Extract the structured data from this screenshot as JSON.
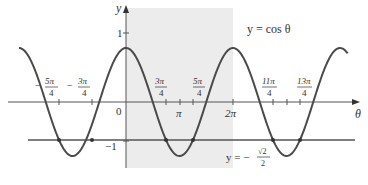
{
  "chart_data": {
    "type": "line",
    "title": "",
    "xlabel": "θ",
    "ylabel": "y",
    "xlim_radians": [
      -6.283,
      14.0
    ],
    "ylim": [
      -1.3,
      1.3
    ],
    "grid": false,
    "series": [
      {
        "name": "y = cos θ",
        "function": "cos(theta)",
        "x_range": [
          "-2π",
          "4π+"
        ],
        "color": "#4a4a4a"
      },
      {
        "name": "y = -√2/2",
        "function": "constant",
        "value": -0.7071,
        "color": "#4a4a4a"
      }
    ],
    "shaded_region": {
      "x_from": "0",
      "x_to": "2π",
      "color": "#ececec"
    },
    "intersection_points": [
      "-5π/4",
      "-3π/4",
      "3π/4",
      "5π/4",
      "11π/4",
      "13π/4"
    ],
    "x_tick_labels": [
      {
        "label": "-5π/4",
        "value": -3.927
      },
      {
        "label": "-3π/4",
        "value": -2.356
      },
      {
        "label": "0",
        "value": 0
      },
      {
        "label": "3π/4",
        "value": 2.356
      },
      {
        "label": "π",
        "value": 3.1416
      },
      {
        "label": "5π/4",
        "value": 3.927
      },
      {
        "label": "2π",
        "value": 6.2832
      },
      {
        "label": "11π/4",
        "value": 8.639
      },
      {
        "label": "13π/4",
        "value": 10.21
      }
    ],
    "y_tick_labels": [
      {
        "label": "1",
        "value": 1
      },
      {
        "label": "-1",
        "value": -1
      }
    ],
    "annotations": [
      {
        "text": "y = cos θ",
        "position": "upper right"
      },
      {
        "text": "y = -√2/2",
        "position": "below line, right of shaded region"
      }
    ]
  },
  "labels": {
    "y_axis": "y",
    "x_axis": "θ",
    "origin": "0",
    "one": "1",
    "minus_one": "−1",
    "pi": "π",
    "two_pi": "2π",
    "cos_label": "y = cos θ",
    "line_label_prefix": "y = −",
    "sqrt2": "√2",
    "two": "2",
    "four": "4",
    "neg_5pi_num": "5π",
    "neg_3pi_num": "3π",
    "pos_3pi_num": "3π",
    "pos_5pi_num": "5π",
    "pos_11pi_num": "11π",
    "pos_13pi_num": "13π",
    "minus": "−"
  }
}
